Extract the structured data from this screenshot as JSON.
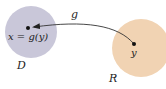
{
  "diagram": {
    "set_D": {
      "label": "D",
      "point_label": "x = g(y)",
      "color": "#c9c7d9"
    },
    "set_R": {
      "label": "R",
      "point_label": "y",
      "color": "#f1d3b3"
    },
    "mapping": {
      "label": "g",
      "direction": "from R to D"
    }
  }
}
